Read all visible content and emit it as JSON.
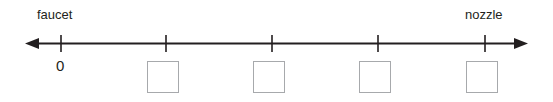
{
  "diagram": {
    "type": "number-line",
    "background_color": "#ffffff",
    "line_color": "#231f20",
    "box_border_color": "#a7a9ac",
    "text_color": "#231f20",
    "labels": {
      "left_endpoint": "faucet",
      "right_endpoint": "nozzle",
      "origin": "0"
    },
    "axis": {
      "arrow_left_x": 25,
      "arrow_right_x": 528,
      "line_y": 44,
      "double_headed": true,
      "tick_count": 5,
      "tick_positions_px": [
        61,
        166,
        272,
        378,
        485
      ],
      "tick_labels": [
        "0",
        "",
        "",
        "",
        ""
      ]
    },
    "answer_boxes": [
      {
        "name": "answer-box-1",
        "x": 147,
        "y": 61,
        "value": ""
      },
      {
        "name": "answer-box-2",
        "x": 253,
        "y": 61,
        "value": ""
      },
      {
        "name": "answer-box-3",
        "x": 359,
        "y": 61,
        "value": ""
      },
      {
        "name": "answer-box-4",
        "x": 466,
        "y": 61,
        "value": ""
      }
    ]
  }
}
